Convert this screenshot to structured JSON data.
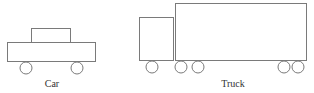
{
  "diagram": {
    "colors": {
      "stroke": "#7a7a7a",
      "text": "#333333",
      "background": "#ffffff"
    },
    "vehicles": [
      {
        "name": "car",
        "label": "Car",
        "label_pos": {
          "x": 52,
          "y": 86
        },
        "parts": {
          "cabin": {
            "x": 31,
            "y": 28,
            "w": 40,
            "h": 14
          },
          "body": {
            "x": 7,
            "y": 42,
            "w": 88,
            "h": 19
          },
          "wheels": [
            {
              "cx": 26,
              "cy": 68,
              "r": 6
            },
            {
              "cx": 77,
              "cy": 68,
              "r": 6
            }
          ]
        }
      },
      {
        "name": "truck",
        "label": "Truck",
        "label_pos": {
          "x": 233,
          "y": 86
        },
        "parts": {
          "cab": {
            "x": 139,
            "y": 17,
            "w": 34,
            "h": 43
          },
          "trailer": {
            "x": 175,
            "y": 3,
            "w": 131,
            "h": 57
          },
          "wheels": [
            {
              "cx": 152,
              "cy": 67,
              "r": 6
            },
            {
              "cx": 181,
              "cy": 67,
              "r": 6
            },
            {
              "cx": 198,
              "cy": 67,
              "r": 6
            },
            {
              "cx": 284,
              "cy": 67,
              "r": 6
            },
            {
              "cx": 298,
              "cy": 67,
              "r": 6
            }
          ]
        }
      }
    ]
  }
}
